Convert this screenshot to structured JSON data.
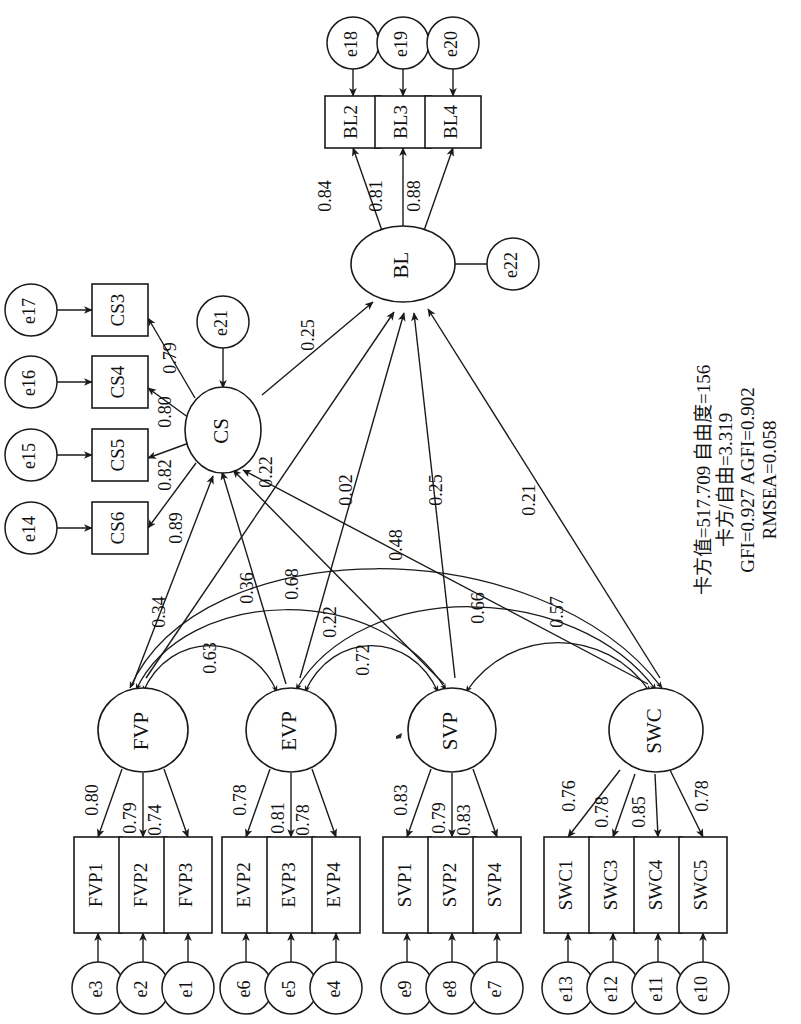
{
  "figure": {
    "type": "sem-path-diagram",
    "orientation": "rotated-90-ccw",
    "background": "#ffffff",
    "stroke_color": "#1a1a1a"
  },
  "latent_factors": [
    {
      "id": "BL",
      "label": "BL",
      "disturbance": "e22"
    },
    {
      "id": "CS",
      "label": "CS",
      "disturbance": "e21"
    },
    {
      "id": "FVP",
      "label": "FVP",
      "disturbance": null
    },
    {
      "id": "EVP",
      "label": "EVP",
      "disturbance": null
    },
    {
      "id": "SVP",
      "label": "SVP",
      "disturbance": null
    },
    {
      "id": "SWC",
      "label": "SWC",
      "disturbance": null
    }
  ],
  "indicators": [
    {
      "label": "BL2",
      "factor": "BL",
      "loading": "0.84",
      "error": "e18"
    },
    {
      "label": "BL3",
      "factor": "BL",
      "loading": "0.81",
      "error": "e19"
    },
    {
      "label": "BL4",
      "factor": "BL",
      "loading": "0.88",
      "error": "e20"
    },
    {
      "label": "CS3",
      "factor": "CS",
      "loading": "0.79",
      "error": "e17"
    },
    {
      "label": "CS4",
      "factor": "CS",
      "loading": "0.80",
      "error": "e16"
    },
    {
      "label": "CS5",
      "factor": "CS",
      "loading": "0.82",
      "error": "e15"
    },
    {
      "label": "CS6",
      "factor": "CS",
      "loading": "0.89",
      "error": "e14"
    },
    {
      "label": "FVP1",
      "factor": "FVP",
      "loading": "0.80",
      "error": "e3"
    },
    {
      "label": "FVP2",
      "factor": "FVP",
      "loading": "0.79",
      "error": "e2"
    },
    {
      "label": "FVP3",
      "factor": "FVP",
      "loading": "0.74",
      "error": "e1"
    },
    {
      "label": "EVP2",
      "factor": "EVP",
      "loading": "0.78",
      "error": "e6"
    },
    {
      "label": "EVP3",
      "factor": "EVP",
      "loading": "0.81",
      "error": "e5"
    },
    {
      "label": "EVP4",
      "factor": "EVP",
      "loading": "0.78",
      "error": "e4"
    },
    {
      "label": "SVP1",
      "factor": "SVP",
      "loading": "0.83",
      "error": "e9"
    },
    {
      "label": "SVP2",
      "factor": "SVP",
      "loading": "0.79",
      "error": "e8"
    },
    {
      "label": "SVP4",
      "factor": "SVP",
      "loading": "0.83",
      "error": "e7"
    },
    {
      "label": "SWC1",
      "factor": "SWC",
      "loading": "0.76",
      "error": "e13"
    },
    {
      "label": "SWC3",
      "factor": "SWC",
      "loading": "0.78",
      "error": "e12"
    },
    {
      "label": "SWC4",
      "factor": "SWC",
      "loading": "0.85",
      "error": "e11"
    },
    {
      "label": "SWC5",
      "factor": "SWC",
      "loading": "0.78",
      "error": "e10"
    }
  ],
  "structural_paths": [
    {
      "from": "CS",
      "to": "BL",
      "coefficient": "0.25"
    },
    {
      "from": "FVP",
      "to": "BL",
      "coefficient": "0.02"
    },
    {
      "from": "EVP",
      "to": "BL",
      "coefficient": "0.48"
    },
    {
      "from": "SVP",
      "to": "BL",
      "coefficient": "0.25"
    },
    {
      "from": "SWC",
      "to": "BL",
      "coefficient": "0.21"
    },
    {
      "from": "FVP",
      "to": "CS",
      "coefficient": "0.34"
    },
    {
      "from": "EVP",
      "to": "CS",
      "coefficient": "0.36"
    },
    {
      "from": "SVP",
      "to": "CS",
      "coefficient": "0.22"
    },
    {
      "from": "SWC",
      "to": "CS",
      "coefficient": "0.22"
    }
  ],
  "covariances": [
    {
      "between": [
        "FVP",
        "EVP"
      ],
      "coefficient": "0.63"
    },
    {
      "between": [
        "FVP",
        "SVP"
      ],
      "coefficient": "0.22"
    },
    {
      "between": [
        "FVP",
        "SWC"
      ],
      "coefficient": "0.68"
    },
    {
      "between": [
        "EVP",
        "SVP"
      ],
      "coefficient": "0.72"
    },
    {
      "between": [
        "EVP",
        "SWC"
      ],
      "coefficient": "0.66"
    },
    {
      "between": [
        "SVP",
        "SWC"
      ],
      "coefficient": "0.57"
    }
  ],
  "fit_statistics": {
    "line1": "卡方值=517.709 自由度=156",
    "line2": "卡方/自由=3.319",
    "line3": "GFI=0.927 AGFI=0.902",
    "line4": "RMSEA=0.058",
    "chi_square": "517.709",
    "df": "156",
    "chi_square_over_df": "3.319",
    "gfi": "0.927",
    "agfi": "0.902",
    "rmsea": "0.058"
  },
  "node_labels": {
    "BL": "BL",
    "CS": "CS",
    "FVP": "FVP",
    "EVP": "EVP",
    "SVP": "SVP",
    "SWC": "SWC",
    "e1": "e1",
    "e2": "e2",
    "e3": "e3",
    "e4": "e4",
    "e5": "e5",
    "e6": "e6",
    "e7": "e7",
    "e8": "e8",
    "e9": "e9",
    "e10": "e10",
    "e11": "e11",
    "e12": "e12",
    "e13": "e13",
    "e14": "e14",
    "e15": "e15",
    "e16": "e16",
    "e17": "e17",
    "e18": "e18",
    "e19": "e19",
    "e20": "e20",
    "e21": "e21",
    "e22": "e22",
    "BL2": "BL2",
    "BL3": "BL3",
    "BL4": "BL4",
    "CS3": "CS3",
    "CS4": "CS4",
    "CS5": "CS5",
    "CS6": "CS6",
    "FVP1": "FVP1",
    "FVP2": "FVP2",
    "FVP3": "FVP3",
    "EVP2": "EVP2",
    "EVP3": "EVP3",
    "EVP4": "EVP4",
    "SVP1": "SVP1",
    "SVP2": "SVP2",
    "SVP4": "SVP4",
    "SWC1": "SWC1",
    "SWC3": "SWC3",
    "SWC4": "SWC4",
    "SWC5": "SWC5"
  },
  "coefficients": {
    "BL2": "0.84",
    "BL3": "0.81",
    "BL4": "0.88",
    "CS3": "0.79",
    "CS4": "0.80",
    "CS5": "0.82",
    "CS6": "0.89",
    "FVP1": "0.80",
    "FVP2": "0.79",
    "FVP3": "0.74",
    "EVP2": "0.78",
    "EVP3": "0.81",
    "EVP4": "0.78",
    "SVP1": "0.83",
    "SVP2": "0.79",
    "SVP4": "0.83",
    "SWC1": "0.76",
    "SWC3": "0.78",
    "SWC4": "0.85",
    "SWC5": "0.78",
    "CS_BL": "0.25",
    "FVP_BL": "0.02",
    "EVP_BL": "0.48",
    "SVP_BL": "0.25",
    "SWC_BL": "0.21",
    "FVP_CS": "0.34",
    "EVP_CS": "0.36",
    "SVP_CS": "0.22",
    "SWC_CS": "0.22",
    "FVP_EVP": "0.63",
    "FVP_SVP": "0.22",
    "FVP_SWC": "0.68",
    "EVP_SVP": "0.72",
    "EVP_SWC": "0.66",
    "SVP_SWC": "0.57"
  }
}
